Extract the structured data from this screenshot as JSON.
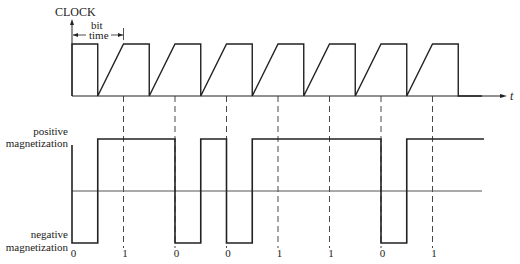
{
  "clock": {
    "title": "CLOCK",
    "bit_time_line1": "bit",
    "bit_time_line2": "time",
    "axis_label": "t",
    "rising_edges_x": [
      72,
      123.5,
      175,
      226.5,
      278,
      329.5,
      381,
      432.5
    ],
    "half_period": 25.75,
    "high_y": 44,
    "low_y": 96
  },
  "magnetization": {
    "positive_label_line1": "positive",
    "positive_label_line2": "magnetization",
    "negative_label_line1": "negative",
    "negative_label_line2": "magnetization",
    "positive_y": 139,
    "negative_y": 243,
    "midline_y": 191
  },
  "bits": [
    "0",
    "1",
    "0",
    "0",
    "1",
    "1",
    "0",
    "1"
  ],
  "colors": {
    "line": "#222222",
    "midline": "#555555",
    "dashed": "#333333"
  }
}
